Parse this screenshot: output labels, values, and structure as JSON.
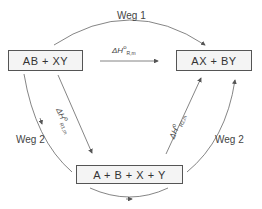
{
  "diagram": {
    "boxes": {
      "reactants": "AB  +  XY",
      "products": "AX  +  BY",
      "atoms": "A + B + X + Y"
    },
    "paths": {
      "path1_label": "Weg 1",
      "path2_left_label": "Weg 2",
      "path2_right_label": "Weg 2"
    },
    "enthalpies": {
      "direct": {
        "symbol": "ΔH",
        "sup": "o",
        "sub": "R,m"
      },
      "step1": {
        "symbol": "ΔH",
        "sup": "o",
        "sub": "R1,m"
      },
      "step2": {
        "symbol": "ΔH",
        "sup": "o",
        "sub": "R2,m"
      }
    }
  }
}
